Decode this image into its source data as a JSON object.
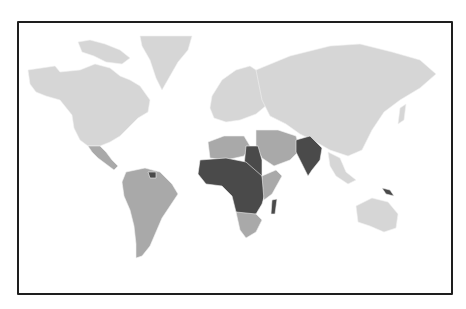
{
  "map": {
    "type": "choropleth",
    "projection": "world (Robinson-like)",
    "palette": {
      "background": "#ffffff",
      "frame": "#1e1e1e",
      "low": "#d6d6d6",
      "medium": "#a9a9a9",
      "high": "#4a4a4a",
      "border": "#f2f2f2"
    },
    "shading_levels": [
      {
        "level": "low",
        "color": "#d6d6d6",
        "regions": [
          "North America (USA, Canada)",
          "Greenland",
          "Europe",
          "Russia",
          "China",
          "Central Asia",
          "Australia",
          "Southeast Asia"
        ]
      },
      {
        "level": "medium",
        "color": "#a9a9a9",
        "regions": [
          "Mexico",
          "Central America",
          "South America",
          "North Africa (Algeria, Libya)",
          "Middle East",
          "Southern Africa",
          "East Africa (Kenya/Ethiopia coast)"
        ]
      },
      {
        "level": "high",
        "color": "#4a4a4a",
        "regions": [
          "West Africa",
          "Central Africa",
          "Sudan/Egypt area",
          "Madagascar",
          "India",
          "Pakistan",
          "Papua New Guinea",
          "Guyana/Suriname"
        ]
      }
    ]
  }
}
